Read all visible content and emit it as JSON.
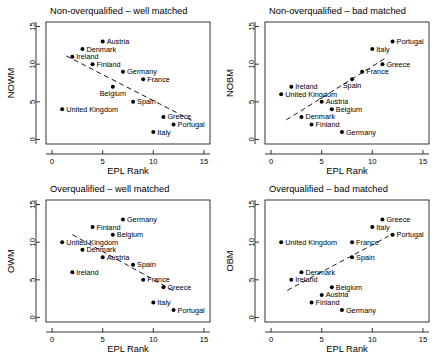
{
  "figure": {
    "xlabel": "EPL Rank",
    "x_ticks": [
      "0",
      "5",
      "10",
      "15"
    ],
    "y_ticks": [
      "0",
      "5",
      "10",
      "15"
    ],
    "xlim": [
      -0.6,
      15.6
    ],
    "ylim": [
      -0.6,
      15.6
    ]
  },
  "chart_data": [
    {
      "type": "scatter",
      "panel": "top-left",
      "title": "Non-overqualified – well matched",
      "xlabel": "EPL Rank",
      "ylabel": "NOWM",
      "xlim": [
        -0.6,
        15.6
      ],
      "ylim": [
        -0.6,
        15.6
      ],
      "x_ticks": [
        0,
        5,
        10,
        15
      ],
      "y_ticks": [
        0,
        5,
        10,
        15
      ],
      "grid": false,
      "legend": "none",
      "trendline": {
        "style": "dashed",
        "x": [
          1.4,
          14.0
        ],
        "y": [
          11.1,
          2.4
        ],
        "direction": "negative"
      },
      "points": [
        {
          "label": "Austria",
          "x": 5,
          "y": 13,
          "label_pos": "right"
        },
        {
          "label": "Denmark",
          "x": 3,
          "y": 12,
          "label_pos": "right"
        },
        {
          "label": "Ireland",
          "x": 2,
          "y": 11,
          "label_pos": "right"
        },
        {
          "label": "Finland",
          "x": 4,
          "y": 10,
          "label_pos": "right"
        },
        {
          "label": "Germany",
          "x": 7,
          "y": 9,
          "label_pos": "right"
        },
        {
          "label": "France",
          "x": 9,
          "y": 8,
          "label_pos": "right"
        },
        {
          "label": "Belgium",
          "x": 6,
          "y": 7,
          "label_pos": "below"
        },
        {
          "label": "Spain",
          "x": 8,
          "y": 5,
          "label_pos": "right"
        },
        {
          "label": "United Kingdom",
          "x": 1,
          "y": 4,
          "label_pos": "right"
        },
        {
          "label": "Greece",
          "x": 11,
          "y": 3,
          "label_pos": "right"
        },
        {
          "label": "Portugal",
          "x": 12,
          "y": 2,
          "label_pos": "right"
        },
        {
          "label": "Italy",
          "x": 10,
          "y": 1,
          "label_pos": "right"
        }
      ]
    },
    {
      "type": "scatter",
      "panel": "top-right",
      "title": "Non-overqualified – bad matched",
      "xlabel": "EPL Rank",
      "ylabel": "NOBM",
      "xlim": [
        -0.6,
        15.6
      ],
      "ylim": [
        -0.6,
        15.6
      ],
      "x_ticks": [
        0,
        5,
        10,
        15
      ],
      "y_ticks": [
        0,
        5,
        10,
        15
      ],
      "grid": false,
      "legend": "none",
      "trendline": {
        "style": "dashed",
        "x": [
          1.5,
          11.3
        ],
        "y": [
          2.6,
          10.8
        ],
        "direction": "positive"
      },
      "points": [
        {
          "label": "Portugal",
          "x": 12,
          "y": 13,
          "label_pos": "right"
        },
        {
          "label": "Italy",
          "x": 10,
          "y": 12,
          "label_pos": "right"
        },
        {
          "label": "Greece",
          "x": 11,
          "y": 10,
          "label_pos": "right"
        },
        {
          "label": "France",
          "x": 9,
          "y": 9,
          "label_pos": "right"
        },
        {
          "label": "Spain",
          "x": 8,
          "y": 8,
          "label_pos": "below"
        },
        {
          "label": "Ireland",
          "x": 2,
          "y": 7,
          "label_pos": "right"
        },
        {
          "label": "United Kingdom",
          "x": 1,
          "y": 6,
          "label_pos": "right"
        },
        {
          "label": "Austria",
          "x": 5,
          "y": 5,
          "label_pos": "right"
        },
        {
          "label": "Belgium",
          "x": 6,
          "y": 4,
          "label_pos": "right"
        },
        {
          "label": "Denmark",
          "x": 3,
          "y": 3,
          "label_pos": "right"
        },
        {
          "label": "Finland",
          "x": 4,
          "y": 2,
          "label_pos": "right"
        },
        {
          "label": "Germany",
          "x": 7,
          "y": 1,
          "label_pos": "right"
        }
      ]
    },
    {
      "type": "scatter",
      "panel": "bottom-left",
      "title": "Overqualified – well matched",
      "xlabel": "EPL Rank",
      "ylabel": "OWM",
      "xlim": [
        -0.6,
        15.6
      ],
      "ylim": [
        -0.6,
        15.6
      ],
      "x_ticks": [
        0,
        5,
        10,
        15
      ],
      "y_ticks": [
        0,
        5,
        10,
        15
      ],
      "grid": false,
      "legend": "none",
      "trendline": {
        "style": "dashed",
        "x": [
          2.0,
          12.2
        ],
        "y": [
          11.0,
          3.4
        ],
        "direction": "negative"
      },
      "points": [
        {
          "label": "Germany",
          "x": 7,
          "y": 13,
          "label_pos": "right"
        },
        {
          "label": "Finland",
          "x": 4,
          "y": 12,
          "label_pos": "right"
        },
        {
          "label": "Belgium",
          "x": 6,
          "y": 11,
          "label_pos": "right"
        },
        {
          "label": "United Kingdom",
          "x": 1,
          "y": 10,
          "label_pos": "right"
        },
        {
          "label": "Denmark",
          "x": 3,
          "y": 9,
          "label_pos": "right"
        },
        {
          "label": "Austria",
          "x": 5,
          "y": 8,
          "label_pos": "right"
        },
        {
          "label": "Spain",
          "x": 8,
          "y": 7,
          "label_pos": "right"
        },
        {
          "label": "Ireland",
          "x": 2,
          "y": 6,
          "label_pos": "right"
        },
        {
          "label": "France",
          "x": 9,
          "y": 5,
          "label_pos": "right"
        },
        {
          "label": "Greece",
          "x": 11,
          "y": 4,
          "label_pos": "right"
        },
        {
          "label": "Italy",
          "x": 10,
          "y": 2,
          "label_pos": "right"
        },
        {
          "label": "Portugal",
          "x": 12,
          "y": 1,
          "label_pos": "right"
        }
      ]
    },
    {
      "type": "scatter",
      "panel": "bottom-right",
      "title": "Overqualified – bad matched",
      "xlabel": "EPL Rank",
      "ylabel": "OBM",
      "xlim": [
        -0.6,
        15.6
      ],
      "ylim": [
        -0.6,
        15.6
      ],
      "x_ticks": [
        0,
        5,
        10,
        15
      ],
      "y_ticks": [
        0,
        5,
        10,
        15
      ],
      "grid": false,
      "legend": "none",
      "trendline": {
        "style": "dashed",
        "x": [
          1.6,
          11.6
        ],
        "y": [
          3.6,
          10.8
        ],
        "direction": "positive"
      },
      "points": [
        {
          "label": "Greece",
          "x": 11,
          "y": 13,
          "label_pos": "right"
        },
        {
          "label": "Italy",
          "x": 10,
          "y": 12,
          "label_pos": "right"
        },
        {
          "label": "Portugal",
          "x": 12,
          "y": 11,
          "label_pos": "right"
        },
        {
          "label": "United Kingdom",
          "x": 1,
          "y": 10,
          "label_pos": "right"
        },
        {
          "label": "France",
          "x": 8,
          "y": 10,
          "label_pos": "right"
        },
        {
          "label": "Spain",
          "x": 8,
          "y": 8,
          "label_pos": "right"
        },
        {
          "label": "Denmark",
          "x": 3,
          "y": 6,
          "label_pos": "right"
        },
        {
          "label": "Ireland",
          "x": 2,
          "y": 5,
          "label_pos": "right"
        },
        {
          "label": "Belgium",
          "x": 6,
          "y": 4,
          "label_pos": "right"
        },
        {
          "label": "Austria",
          "x": 5,
          "y": 3,
          "label_pos": "right"
        },
        {
          "label": "Finland",
          "x": 4,
          "y": 2,
          "label_pos": "right"
        },
        {
          "label": "Germany",
          "x": 7,
          "y": 1,
          "label_pos": "right"
        }
      ]
    }
  ]
}
